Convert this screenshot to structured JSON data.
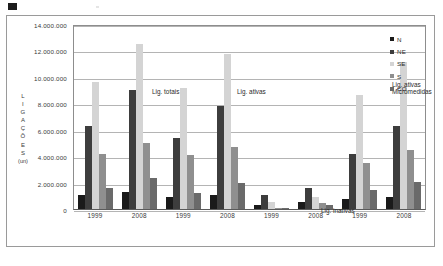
{
  "chart_data": {
    "type": "bar",
    "title": "",
    "subtitle": "",
    "xlabel": "",
    "ylabel": "LIGAÇÕES (un)",
    "ylabel_stacked": [
      "L",
      "I",
      "G",
      "A",
      "Ç",
      "Õ",
      "E",
      "S",
      "(un)"
    ],
    "ylim": [
      0,
      14000000
    ],
    "ytick_values": [
      14000000,
      12000000,
      10000000,
      8000000,
      6000000,
      4000000,
      2000000,
      0
    ],
    "ytick_labels": [
      "14.000.000",
      "12.000.000",
      "10.000.000",
      "8.000.000",
      "6.000.000",
      "4.000.000",
      "2.000.000",
      "0"
    ],
    "grid": true,
    "grid_axis": "y",
    "legend_position": "top-right",
    "categories": [
      "1999",
      "2008",
      "1999",
      "2008",
      "1999",
      "2008",
      "1999",
      "2008"
    ],
    "group_annotations": [
      {
        "label": "Lig. totais",
        "groups": [
          0,
          1
        ]
      },
      {
        "label": "Lig. ativas",
        "groups": [
          2,
          3
        ]
      },
      {
        "label": "Lig. inativas",
        "groups": [
          4,
          5
        ]
      },
      {
        "label": "Lig. ativas Micromedidas",
        "groups": [
          6,
          7
        ]
      }
    ],
    "series": [
      {
        "name": "N",
        "color": "#1a1a1a",
        "values": [
          1080000,
          1320000,
          920000,
          1080000,
          330000,
          500000,
          760000,
          900000
        ]
      },
      {
        "name": "NE",
        "color": "#3d3d3d",
        "values": [
          6300000,
          9020000,
          5400000,
          7800000,
          1080000,
          1620000,
          4150000,
          6250000
        ]
      },
      {
        "name": "SE",
        "color": "#d4d4d4",
        "values": [
          9600000,
          12500000,
          9150000,
          11750000,
          520000,
          900000,
          8600000,
          11100000
        ]
      },
      {
        "name": "S",
        "color": "#8f8f8f",
        "values": [
          4150000,
          5000000,
          4100000,
          4700000,
          100000,
          420000,
          3500000,
          4450000
        ]
      },
      {
        "name": "CO",
        "color": "#6a6a6a",
        "values": [
          1560000,
          2380000,
          1230000,
          2000000,
          70000,
          330000,
          1470000,
          2080000
        ]
      }
    ],
    "legend_entries": [
      {
        "name": "N",
        "color": "#1a1a1a"
      },
      {
        "name": "NE",
        "color": "#3d3d3d"
      },
      {
        "name": "SE",
        "color": "#d4d4d4"
      },
      {
        "name": "S",
        "color": "#8f8f8f"
      },
      {
        "name": "CO",
        "color": "#6a6a6a"
      }
    ]
  }
}
